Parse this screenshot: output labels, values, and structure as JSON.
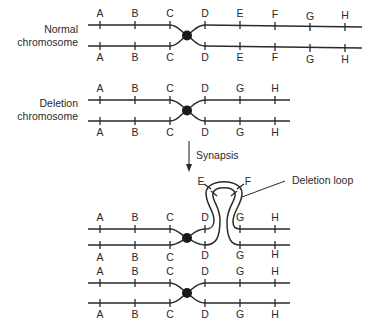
{
  "labels": {
    "normal_line1": "Normal",
    "normal_line2": "chromosome",
    "deletion_line1": "Deletion",
    "deletion_line2": "chromosome",
    "synapsis": "Synapsis",
    "deletion_loop": "Deletion loop"
  },
  "normal_genes": [
    "A",
    "B",
    "C",
    "D",
    "E",
    "F",
    "G",
    "H"
  ],
  "deletion_genes": [
    "A",
    "B",
    "C",
    "D",
    "G",
    "H"
  ],
  "loop_genes": [
    "E",
    "F"
  ],
  "colors": {
    "ink": "#2a2a2a",
    "background": "#ffffff"
  }
}
